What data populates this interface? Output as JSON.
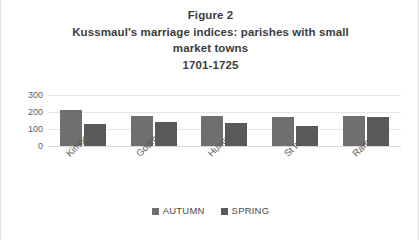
{
  "chart_data": {
    "type": "bar",
    "title": "Figure 2",
    "title_lines": [
      "Figure 2",
      "Kussmaul's marriage indices: parishes with small",
      "market towns",
      "1701-1725"
    ],
    "xlabel": "",
    "ylabel": "",
    "ylim": [
      0,
      300
    ],
    "yticks": [
      300,
      200,
      100,
      0
    ],
    "grid": true,
    "legend_position": "bottom",
    "categories": [
      "Kimbolton",
      "Godman...",
      "Hunting...",
      "St Ives",
      "Ramsey"
    ],
    "series": [
      {
        "name": "AUTUMN",
        "color": "#6f6f6f",
        "values": [
          210,
          175,
          175,
          170,
          175
        ]
      },
      {
        "name": "SPRING",
        "color": "#595959",
        "values": [
          130,
          140,
          135,
          115,
          168
        ]
      }
    ]
  },
  "legend": {
    "items": [
      {
        "label": "AUTUMN"
      },
      {
        "label": "SPRING"
      }
    ]
  }
}
